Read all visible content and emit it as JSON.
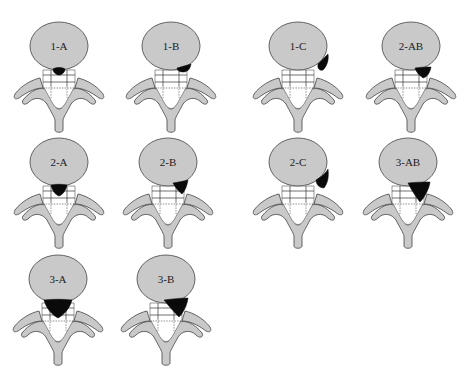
{
  "diagram": {
    "colors": {
      "background": "#ffffff",
      "vertebral_body": "#c9c9c9",
      "outline": "#555555",
      "herniation": "#0a0a0a"
    },
    "vertebrae": [
      {
        "label": "1-A",
        "cx": 59,
        "top": 20,
        "lesion": "1-A"
      },
      {
        "label": "1-B",
        "cx": 171,
        "top": 20,
        "lesion": "1-B"
      },
      {
        "label": "1-C",
        "cx": 298,
        "top": 20,
        "lesion": "1-C"
      },
      {
        "label": "2-AB",
        "cx": 411,
        "top": 20,
        "lesion": "2-AB"
      },
      {
        "label": "2-A",
        "cx": 59,
        "top": 136,
        "lesion": "2-A"
      },
      {
        "label": "2-B",
        "cx": 168,
        "top": 136,
        "lesion": "2-B"
      },
      {
        "label": "2-C",
        "cx": 298,
        "top": 136,
        "lesion": "2-C"
      },
      {
        "label": "3-AB",
        "cx": 408,
        "top": 136,
        "lesion": "3-AB"
      },
      {
        "label": "3-A",
        "cx": 58,
        "top": 253,
        "lesion": "3-A"
      },
      {
        "label": "3-B",
        "cx": 166,
        "top": 253,
        "lesion": "3-B"
      }
    ]
  }
}
